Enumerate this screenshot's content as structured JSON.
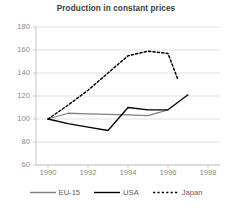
{
  "chart_data": {
    "type": "line",
    "title": "Production in constant prices",
    "xlabel": "",
    "ylabel": "",
    "xlim": [
      1989.4,
      1998.6
    ],
    "ylim": [
      60,
      180
    ],
    "yticks": [
      60,
      80,
      100,
      120,
      140,
      160,
      180
    ],
    "xticks": [
      1990,
      1992,
      1994,
      1996,
      1998
    ],
    "grid": "horizontal",
    "legend_position": "bottom",
    "series": [
      {
        "name": "EU-15",
        "color": "#7f7f7f",
        "style": "solid",
        "x": [
          1990,
          1991,
          1992,
          1993,
          1994,
          1995,
          1996
        ],
        "values": [
          100,
          105,
          104.5,
          104,
          103.5,
          103,
          108
        ]
      },
      {
        "name": "USA",
        "color": "#000000",
        "style": "solid",
        "x": [
          1990,
          1991,
          1992,
          1993,
          1994,
          1995,
          1996,
          1997
        ],
        "values": [
          100,
          96,
          93,
          90,
          110,
          108,
          108,
          121
        ]
      },
      {
        "name": "Japan",
        "color": "#000000",
        "style": "dashed",
        "x": [
          1990,
          1991,
          1992,
          1993,
          1994,
          1995,
          1996,
          1996.5
        ],
        "values": [
          100,
          112,
          125,
          140,
          155,
          159,
          157,
          134
        ]
      }
    ]
  },
  "legend": {
    "items": [
      {
        "label": "EU-15"
      },
      {
        "label": "USA"
      },
      {
        "label": "Japan"
      }
    ]
  }
}
